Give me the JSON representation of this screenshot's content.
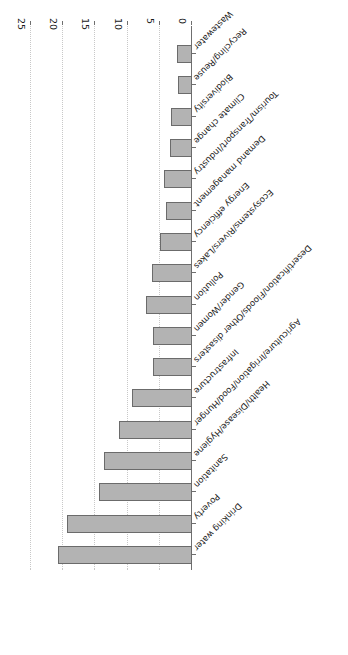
{
  "chart_data": {
    "type": "bar",
    "orientation": "horizontal",
    "title": "",
    "subtitle": "",
    "xlabel": "",
    "ylabel": "",
    "xlim": [
      0,
      25
    ],
    "xticks": [
      0,
      5,
      10,
      15,
      20,
      25
    ],
    "xtick_labels": [
      "0",
      "5",
      "10",
      "15",
      "20",
      "25"
    ],
    "grid": true,
    "legend": false,
    "rotated_180": true,
    "bar_color": "#b3b3b3",
    "bar_edge_color": "#6b6b6b",
    "axis_color": "#6f6f6f",
    "grid_color": "#c8c8c8",
    "categories": [
      "Drinking water",
      "Poverty",
      "Sanitation",
      "Health/Disease/Hygiene",
      "Agriculture/Irrigation/Food/Hunger",
      "Infrastructure",
      "Desertification/Floods/Other disasters",
      "Gender/Women",
      "Pollution",
      "Ecosystems/Rivers/Lakes",
      "Energy efficiency",
      "Demand management",
      "Tourism/Transport/Industry",
      "Climate change",
      "Biodiversity",
      "Recycling/Reuse",
      "Wastewater"
    ],
    "values": [
      20.8,
      19.4,
      14.4,
      13.6,
      11.3,
      9.3,
      6.1,
      6.1,
      7.2,
      6.2,
      5.0,
      4.1,
      4.3,
      3.4,
      3.2,
      2.1,
      2.3
    ]
  }
}
